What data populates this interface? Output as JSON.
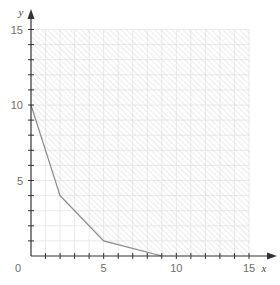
{
  "chart_data": {
    "type": "area",
    "title": "",
    "xlabel": "x",
    "ylabel": "y",
    "xlim": [
      0,
      15
    ],
    "ylim": [
      0,
      15
    ],
    "x_ticks_labeled": [
      5,
      10,
      15
    ],
    "y_ticks_labeled": [
      5,
      10,
      15
    ],
    "origin_label": "0",
    "minor_tick_step": 1,
    "grid": true,
    "boundary": {
      "name": "feasible region lower boundary",
      "points": [
        [
          0,
          10
        ],
        [
          2,
          4
        ],
        [
          5,
          1
        ],
        [
          9,
          0
        ]
      ]
    },
    "shaded_region": {
      "description": "hatched region above the boundary, bounded by x=15 and y=15",
      "fill": "hatched"
    },
    "colors": {
      "axis": "#333333",
      "grid": "#e4e4e4",
      "hatch": "#cfcfcf",
      "boundary": "#8a8a8a",
      "label": "#6e6e6e"
    }
  }
}
